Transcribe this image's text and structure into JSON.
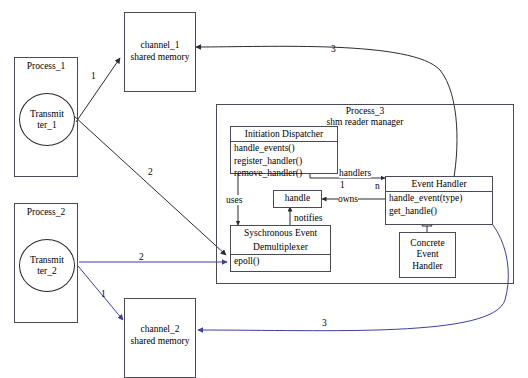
{
  "diagram": {
    "colors": {
      "black_edge": "#2b2b33",
      "blue_edge": "#3b3f9e",
      "box_stroke": "#4a4a56",
      "background": "#ffffff",
      "text": "#000000"
    }
  },
  "processes": [
    {
      "id": "process_1",
      "title": "Process_1",
      "actor": {
        "line1": "Transmit",
        "line2": "ter_1"
      }
    },
    {
      "id": "process_2",
      "title": "Process_2",
      "actor": {
        "line1": "Transmit",
        "line2": "ter_2"
      }
    }
  ],
  "channels": [
    {
      "id": "channel_1",
      "line1": "channel_1",
      "line2": "shared memory"
    },
    {
      "id": "channel_2",
      "line1": "channel_2",
      "line2": "shared memory"
    }
  ],
  "process_3": {
    "title_line1": "Process_3",
    "title_line2": "shm reader manager",
    "classes": {
      "initiation_dispatcher": {
        "name": "Initiation Dispatcher",
        "operations": [
          "handle_events()",
          "register_handler()",
          "remove_handler()"
        ]
      },
      "event_handler": {
        "name": "Event Handler",
        "operations": [
          "handle_event(type)",
          "get_handle()"
        ]
      },
      "concrete_event_handler": {
        "line1": "Concrete",
        "line2": "Event",
        "line3": "Handler"
      },
      "handle": {
        "name": "handle"
      },
      "demultiplexer": {
        "line1": "Syschronous Event",
        "line2": "Demultiplexer",
        "operations": [
          "epoll()"
        ]
      }
    },
    "relations": {
      "handlers_label": "handlers",
      "mult_one": "1",
      "mult_n": "n",
      "uses_label": "uses",
      "owns_label": "owns",
      "notifies_label": "notifies"
    }
  },
  "flow_labels": {
    "p1_to_channel1": "1",
    "p1_to_epoll": "2",
    "handler_to_channel1": "3",
    "p2_to_channel2": "1",
    "p2_to_epoll": "2",
    "handler_to_channel2": "3"
  }
}
